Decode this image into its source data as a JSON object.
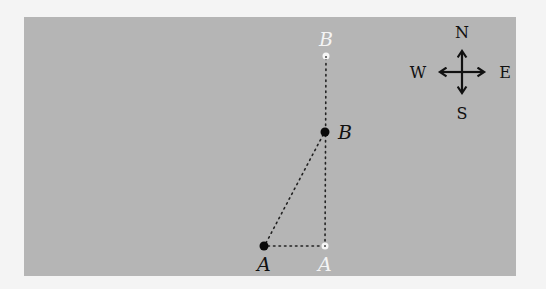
{
  "diagram": {
    "title": "",
    "background_color": "#b5b5b5",
    "points": [
      {
        "id": "B_old",
        "label": "B",
        "x": 326,
        "y": 56,
        "style": "hollow-white"
      },
      {
        "id": "B",
        "label": "B",
        "x": 325,
        "y": 132,
        "style": "filled-black"
      },
      {
        "id": "A",
        "label": "A",
        "x": 264,
        "y": 246,
        "style": "filled-black"
      },
      {
        "id": "A_old",
        "label": "A",
        "x": 325,
        "y": 246,
        "style": "hollow-white"
      }
    ],
    "lines": [
      {
        "from": "B_old",
        "to": "A_old",
        "style": "dotted"
      },
      {
        "from": "A",
        "to": "B",
        "style": "dotted"
      },
      {
        "from": "A",
        "to": "A_old",
        "style": "dotted"
      }
    ],
    "compass": {
      "north": "N",
      "south": "S",
      "east": "E",
      "west": "W"
    }
  }
}
